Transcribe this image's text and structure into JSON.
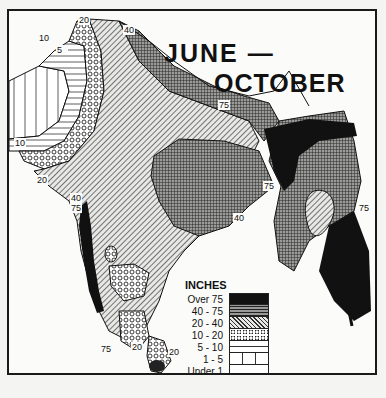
{
  "map": {
    "title_line1": "JUNE —",
    "title_line2": "OCTOBER",
    "subject": "Rainfall, India, June–October",
    "legend": {
      "title": "INCHES",
      "items": [
        {
          "label": "Over 75",
          "pattern": "solid-black"
        },
        {
          "label": "40 - 75",
          "pattern": "dense-crosshatch"
        },
        {
          "label": "20 - 40",
          "pattern": "diagonal-hatch"
        },
        {
          "label": "10 - 20",
          "pattern": "circle-lattice"
        },
        {
          "label": "5 - 10",
          "pattern": "horizontal-lines"
        },
        {
          "label": "1 - 5",
          "pattern": "vertical-lines"
        },
        {
          "label": "Under 1",
          "pattern": "dotted-blank"
        }
      ]
    },
    "contour_labels": [
      {
        "text": "10",
        "x": 30,
        "y": 30
      },
      {
        "text": "20",
        "x": 70,
        "y": 12
      },
      {
        "text": "40",
        "x": 115,
        "y": 22
      },
      {
        "text": "5",
        "x": 48,
        "y": 42
      },
      {
        "text": "10",
        "x": 6,
        "y": 135
      },
      {
        "text": "20",
        "x": 28,
        "y": 172
      },
      {
        "text": "40",
        "x": 62,
        "y": 190
      },
      {
        "text": "75",
        "x": 62,
        "y": 200
      },
      {
        "text": "75",
        "x": 210,
        "y": 97
      },
      {
        "text": "75",
        "x": 255,
        "y": 178
      },
      {
        "text": "40",
        "x": 225,
        "y": 210
      },
      {
        "text": "75",
        "x": 350,
        "y": 200
      },
      {
        "text": "75",
        "x": 92,
        "y": 341
      },
      {
        "text": "20",
        "x": 123,
        "y": 339
      },
      {
        "text": "20",
        "x": 160,
        "y": 344
      },
      {
        "text": "75",
        "x": 135,
        "y": 370
      },
      {
        "text": "40",
        "x": 145,
        "y": 378
      }
    ],
    "colors": {
      "ink": "#111111",
      "paper": "#fbfbfa"
    }
  }
}
